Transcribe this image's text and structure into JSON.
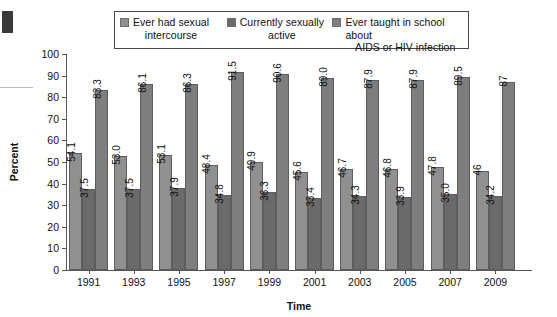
{
  "legend": {
    "items": [
      {
        "label_line1": "Ever had sexual",
        "label_line2": "intercourse",
        "color": "#909090",
        "name": "ever-had-sexual-intercourse"
      },
      {
        "label_line1": "Currently sexually",
        "label_line2": "active",
        "color": "#6a6a6a",
        "name": "currently-sexually-active"
      },
      {
        "label_line1": "Ever taught in school about",
        "label_line2": "AIDS or HIV infection",
        "color": "#7e7e7e",
        "name": "ever-taught-in-school-about-aids-or-hiv-infection"
      }
    ]
  },
  "axes": {
    "ylabel": "Percent",
    "xlabel": "Time",
    "yticks": [
      "0",
      "10",
      "20",
      "30",
      "40",
      "50",
      "60",
      "70",
      "80",
      "90",
      "100"
    ]
  },
  "chart_data": {
    "type": "bar",
    "title": "",
    "xlabel": "Time",
    "ylabel": "Percent",
    "ylim": [
      0,
      100
    ],
    "grid": false,
    "legend_position": "top",
    "categories": [
      "1991",
      "1993",
      "1995",
      "1997",
      "1999",
      "2001",
      "2003",
      "2005",
      "2007",
      "2009"
    ],
    "series": [
      {
        "name": "Ever had sexual intercourse",
        "color": "#909090",
        "values": [
          54.1,
          53.0,
          53.1,
          48.4,
          49.9,
          45.6,
          46.7,
          46.8,
          47.8,
          46
        ],
        "labels": [
          "54.1",
          "53.0",
          "53.1",
          "48.4",
          "49.9",
          "45.6",
          "46.7",
          "46.8",
          "47.8",
          "46"
        ]
      },
      {
        "name": "Currently sexually active",
        "color": "#6a6a6a",
        "values": [
          37.5,
          37.5,
          37.9,
          34.8,
          36.3,
          33.4,
          34.3,
          33.9,
          35.0,
          34.2
        ],
        "labels": [
          "37.5",
          "37.5",
          "37.9",
          "34.8",
          "36.3",
          "33.4",
          "34.3",
          "33.9",
          "35.0",
          "34.2"
        ]
      },
      {
        "name": "Ever taught in school about AIDS or HIV infection",
        "color": "#7e7e7e",
        "values": [
          83.3,
          86.1,
          86.3,
          91.5,
          90.6,
          89.0,
          87.9,
          87.9,
          89.5,
          87
        ],
        "labels": [
          "83.3",
          "86.1",
          "86.3",
          "91.5",
          "90.6",
          "89.0",
          "87.9",
          "87.9",
          "89.5",
          "87"
        ]
      }
    ]
  }
}
